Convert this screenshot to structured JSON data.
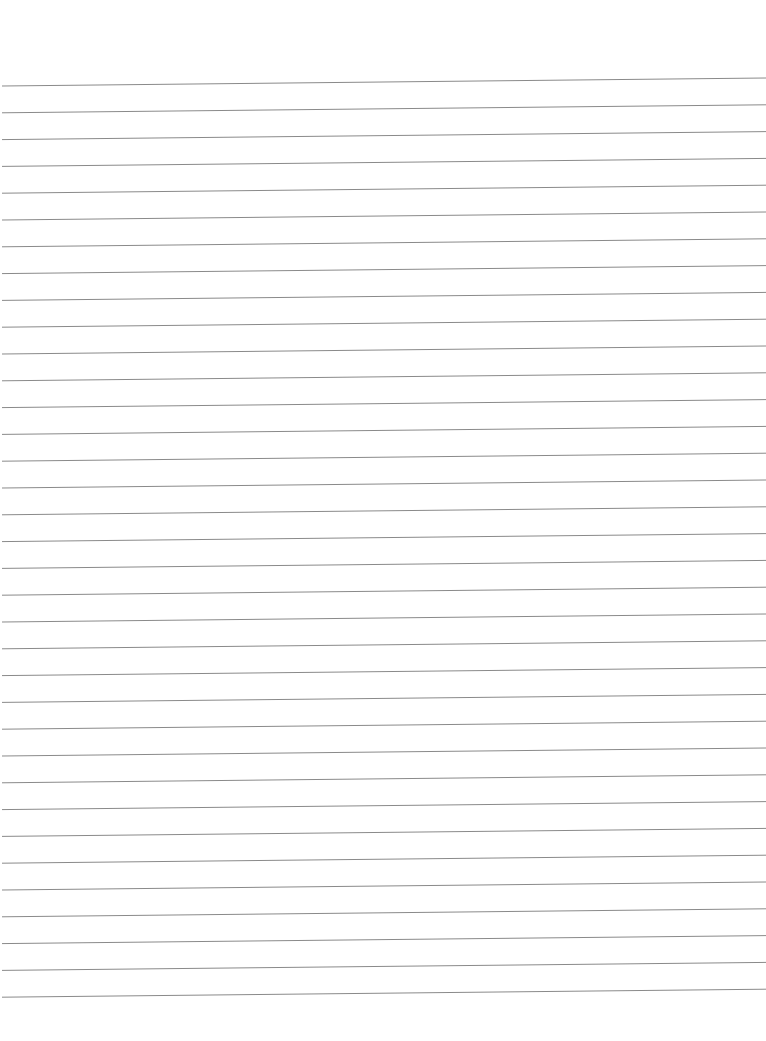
{
  "page": {
    "type": "lined-paper",
    "background_color": "#ffffff",
    "line_color": "#8a8a8a",
    "line_count": 35,
    "first_line_y_left": 86,
    "first_line_y_right": 78,
    "line_spacing": 26.8,
    "line_start_x": 2,
    "line_end_x": 766
  }
}
